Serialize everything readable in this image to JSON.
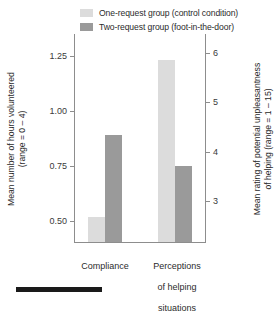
{
  "chart_data": {
    "type": "bar",
    "title": "",
    "subtitle": "",
    "xlabel": "",
    "ylabel": "Mean number of hours volunteered (range = 0 – 4)",
    "y2label": "Mean rating of potential unpleasantness of helping (range = 1 – 15)",
    "categories": [
      "Compliance",
      "Perceptions of helping situations"
    ],
    "category_lines": [
      [
        "Compliance"
      ],
      [
        "Perceptions",
        "of helping",
        "situations"
      ]
    ],
    "series": [
      {
        "name": "One-request group (control condition)",
        "color": "#dcdcdc",
        "values": [
          0.52,
          1.23
        ],
        "values_right_axis": [
          null,
          5.9
        ]
      },
      {
        "name": "Two-request group (foot-in-the-door)",
        "color": "#9a9a9a",
        "values": [
          0.89,
          0.75
        ],
        "values_right_axis": [
          null,
          4.0
        ]
      }
    ],
    "yaxis": {
      "ticks": [
        1.25,
        1.0,
        0.75,
        0.5
      ],
      "tick_labels": [
        "1.25",
        "1.00",
        "0.75",
        "0.50"
      ],
      "ylim": [
        0.4028,
        1.3472
      ],
      "position": "left"
    },
    "y2axis": {
      "ticks": [
        6,
        5,
        4,
        3
      ],
      "tick_labels": [
        "6",
        "5",
        "4",
        "3"
      ],
      "ylim": [
        2.16,
        6.38
      ],
      "position": "right"
    },
    "grid": false,
    "legend_position": "top"
  },
  "legend": {
    "items": [
      {
        "label": "One-request group (control condition)",
        "swatch": "#dcdcdc"
      },
      {
        "label": "Two-request group (foot-in-the-door)",
        "swatch": "#9a9a9a"
      }
    ]
  },
  "axes": {
    "left": {
      "title": "Mean number of hours volunteered",
      "title_line2": "(range = 0 – 4)",
      "tick_labels": [
        "1.25",
        "1.00",
        "0.75",
        "0.50"
      ]
    },
    "right": {
      "title": "Mean rating of potential unpleasantness",
      "title_line2": "of helping (range = 1 – 15)",
      "tick_labels": [
        "6",
        "5",
        "4",
        "3"
      ]
    }
  },
  "categories": {
    "first": "Compliance",
    "second_line1": "Perceptions",
    "second_line2": "of helping",
    "second_line3": "situations"
  },
  "colors": {
    "series_one": "#dcdcdc",
    "series_two": "#9a9a9a",
    "axis": "#8d8d8d",
    "text": "#2b2b2b",
    "rule": "#1a1a1a"
  }
}
